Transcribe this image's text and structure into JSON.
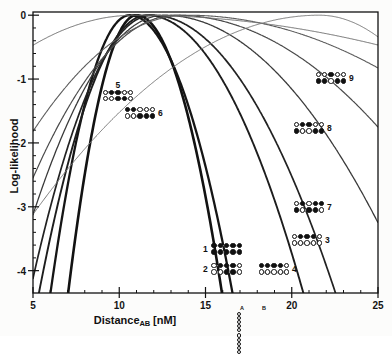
{
  "figure": {
    "kind": "scanned-scientific-plot"
  },
  "axes": {
    "xlabel_text": "Distance",
    "xlabel_sub": "AB",
    "xlabel_unit": " [nM]",
    "ylabel": "Log-likelihood",
    "xticks": [
      "5",
      "10",
      "15",
      "20",
      "25"
    ],
    "yticks": [
      "0",
      "-1",
      "-2",
      "-3",
      "-4"
    ]
  },
  "axis_legend": {
    "label_a": "A",
    "label_b": "B",
    "row_top": [
      "open",
      "open",
      "open",
      "open",
      "open"
    ],
    "row_bottom": [
      "open",
      "open",
      "open",
      "open",
      "open"
    ]
  },
  "clusters": [
    {
      "id": "1",
      "num": "1",
      "num_side": "left",
      "x": 203,
      "y": 243,
      "row_top": [
        "filled",
        "filled",
        "filled",
        "filled",
        "filled"
      ],
      "row_bottom": [
        "filled",
        "filled",
        "filled",
        "filled",
        "filled"
      ]
    },
    {
      "id": "2",
      "num": "2",
      "num_side": "left",
      "x": 203,
      "y": 263,
      "row_top": [
        "open",
        "filled",
        "filled",
        "filled",
        "open"
      ],
      "row_bottom": [
        "open",
        "open",
        "filled",
        "filled",
        "open"
      ]
    },
    {
      "id": "3",
      "num": "3",
      "num_side": "right",
      "x": 291,
      "y": 234,
      "row_top": [
        "open",
        "filled",
        "filled",
        "filled",
        "open"
      ],
      "row_bottom": [
        "open",
        "open",
        "open",
        "open",
        "open"
      ]
    },
    {
      "id": "4",
      "num": "4",
      "num_side": "right",
      "x": 258,
      "y": 263,
      "row_top": [
        "filled",
        "filled",
        "filled",
        "filled",
        "open"
      ],
      "row_bottom": [
        "open",
        "open",
        "open",
        "open",
        "open"
      ]
    },
    {
      "id": "5",
      "num": "5",
      "num_side": "top",
      "x": 102,
      "y": 81,
      "row_top": [
        "open",
        "filled",
        "filled",
        "open",
        "open"
      ],
      "row_bottom": [
        "open",
        "open",
        "filled",
        "filled",
        "open"
      ]
    },
    {
      "id": "6",
      "num": "6",
      "num_side": "right",
      "x": 124,
      "y": 107,
      "row_top": [
        "filled",
        "filled",
        "open",
        "open",
        "open"
      ],
      "row_bottom": [
        "open",
        "open",
        "filled",
        "filled",
        "filled"
      ]
    },
    {
      "id": "7",
      "num": "7",
      "num_side": "right",
      "x": 293,
      "y": 201,
      "row_top": [
        "open",
        "filled",
        "open",
        "filled",
        "filled"
      ],
      "row_bottom": [
        "filled",
        "open",
        "filled",
        "filled",
        "open"
      ]
    },
    {
      "id": "8",
      "num": "8",
      "num_side": "right",
      "x": 293,
      "y": 122,
      "row_top": [
        "open",
        "filled",
        "filled",
        "open",
        "open"
      ],
      "row_bottom": [
        "filled",
        "open",
        "open",
        "filled",
        "filled"
      ]
    },
    {
      "id": "9",
      "num": "9",
      "num_side": "right",
      "x": 315,
      "y": 72,
      "row_top": [
        "open",
        "open",
        "filled",
        "open",
        "open"
      ],
      "row_bottom": [
        "filled",
        "filled",
        "open",
        "filled",
        "filled"
      ]
    }
  ],
  "chart_data": {
    "type": "line",
    "title": "",
    "xlabel": "Distance_AB [nM]",
    "ylabel": "Log-likelihood",
    "xlim": [
      5,
      25
    ],
    "ylim": [
      -4.35,
      0.05
    ],
    "xticks": [
      5,
      10,
      15,
      20,
      25
    ],
    "yticks": [
      0,
      -1,
      -2,
      -3,
      -4
    ],
    "grid": false,
    "legend": "none",
    "note": "Nine log-likelihood profile curves, each a quadratic-like profile peaking at 0 at its maximum-likelihood distance estimate. Curve width encodes the confidence interval; thin light curves are broad (low precision), thick dark curves are narrow (high precision).",
    "series": [
      {
        "name": "1",
        "peak_x": 11.0,
        "half_width": 1.9,
        "asym": 1.25,
        "stroke": "#121212",
        "width": 2.6,
        "label_cluster": "1"
      },
      {
        "name": "2",
        "peak_x": 10.6,
        "half_width": 2.2,
        "asym": 1.3,
        "stroke": "#151515",
        "width": 2.3,
        "label_cluster": "2"
      },
      {
        "name": "3",
        "peak_x": 11.6,
        "half_width": 3.0,
        "asym": 1.45,
        "stroke": "#1d1d1d",
        "width": 1.9,
        "label_cluster": "3"
      },
      {
        "name": "4",
        "peak_x": 11.9,
        "half_width": 3.4,
        "asym": 1.5,
        "stroke": "#222222",
        "width": 1.7,
        "label_cluster": "4"
      },
      {
        "name": "5",
        "peak_x": 12.6,
        "half_width": 4.3,
        "asym": 1.6,
        "stroke": "#3a3a3a",
        "width": 1.3,
        "label_cluster": "5"
      },
      {
        "name": "6",
        "peak_x": 13.3,
        "half_width": 5.2,
        "asym": 1.7,
        "stroke": "#4a4a4a",
        "width": 1.2,
        "label_cluster": "6"
      },
      {
        "name": "7",
        "peak_x": 13.9,
        "half_width": 6.6,
        "asym": 1.85,
        "stroke": "#5d5d5d",
        "width": 1.1,
        "label_cluster": "7"
      },
      {
        "name": "8",
        "peak_x": 10.9,
        "half_width": 8.6,
        "asym": 2.4,
        "stroke": "#6f6f6f",
        "width": 1.0,
        "label_cluster": "8"
      },
      {
        "name": "9",
        "peak_x": 21.6,
        "half_width": 9.4,
        "asym": 0.62,
        "stroke": "#7a7a7a",
        "width": 1.0,
        "label_cluster": "9"
      }
    ]
  }
}
